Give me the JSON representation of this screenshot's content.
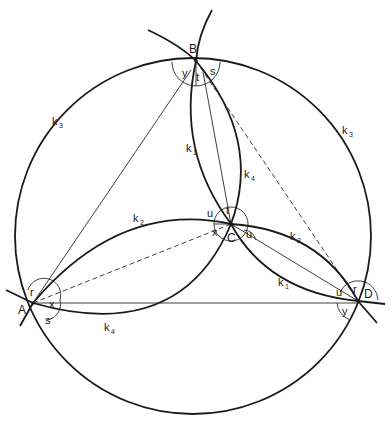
{
  "figure": {
    "type": "geometric-construction",
    "points": [
      {
        "name": "A",
        "x": 33,
        "y": 303
      },
      {
        "name": "B",
        "x": 196,
        "y": 61
      },
      {
        "name": "C",
        "x": 231,
        "y": 224
      },
      {
        "name": "D",
        "x": 358,
        "y": 301
      }
    ],
    "point_labels": {
      "A": "A",
      "B": "B",
      "C": "C",
      "D": "D"
    },
    "curve_labels": {
      "k3_left": {
        "main": "k",
        "sub": "3"
      },
      "k3_right": {
        "main": "k",
        "sub": "3"
      },
      "k1_upper": {
        "main": "k",
        "sub": "1"
      },
      "k4_upper": {
        "main": "k",
        "sub": "4"
      },
      "k2_left": {
        "main": "k",
        "sub": "2"
      },
      "k2_right": {
        "main": "k",
        "sub": "2"
      },
      "k1_right": {
        "main": "k",
        "sub": "1"
      },
      "k4_lower": {
        "main": "k",
        "sub": "4"
      }
    },
    "angle_labels": {
      "B_y": "y",
      "B_t": "t",
      "B_s": "s",
      "C_u_top": "u",
      "C_t": "t",
      "C_x": "x",
      "C_u_right": "u",
      "A_r": "r",
      "A_x": "x",
      "A_s": "s",
      "D_u": "u",
      "D_r": "r",
      "D_y": "y"
    },
    "colors": {
      "ink": "#1a1a1a",
      "background": "#ffffff"
    }
  }
}
